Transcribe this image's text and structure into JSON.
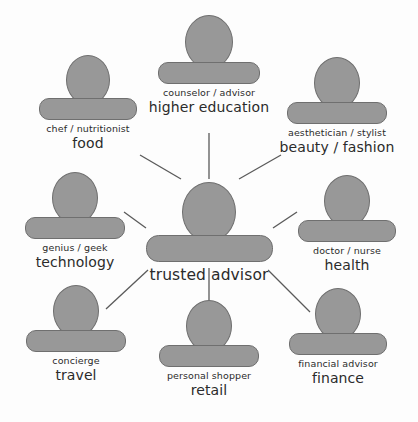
{
  "diagram": {
    "type": "hub-and-spoke",
    "background_color": "#fdfdfd",
    "icon_fill": "#989898",
    "icon_stroke": "#6f6f6f",
    "edge_color": "#5a5a5a",
    "text_color": "#2b2b2b"
  },
  "center": {
    "id": "trusted-advisor",
    "role": "",
    "category": "trusted advisor",
    "x": 209,
    "y": 182,
    "head_w": 52,
    "head_h": 58,
    "body_w": 125,
    "body_h": 25
  },
  "nodes": [
    {
      "id": "food",
      "role": "chef / nutritionist",
      "category": "food",
      "x": 88,
      "y": 55,
      "head_w": 42,
      "head_h": 48,
      "body_w": 96,
      "body_h": 20
    },
    {
      "id": "higher-education",
      "role": "counselor / advisor",
      "category": "higher education",
      "x": 209,
      "y": 15,
      "head_w": 46,
      "head_h": 52,
      "body_w": 100,
      "body_h": 20
    },
    {
      "id": "beauty-fashion",
      "role": "aesthetician / stylist",
      "category": "beauty / fashion",
      "x": 337,
      "y": 57,
      "head_w": 44,
      "head_h": 50,
      "body_w": 98,
      "body_h": 20
    },
    {
      "id": "technology",
      "role": "genius / geek",
      "category": "technology",
      "x": 75,
      "y": 172,
      "head_w": 44,
      "head_h": 50,
      "body_w": 98,
      "body_h": 20
    },
    {
      "id": "health",
      "role": "doctor / nurse",
      "category": "health",
      "x": 347,
      "y": 175,
      "head_w": 44,
      "head_h": 50,
      "body_w": 96,
      "body_h": 20
    },
    {
      "id": "travel",
      "role": "concierge",
      "category": "travel",
      "x": 76,
      "y": 285,
      "head_w": 44,
      "head_h": 50,
      "body_w": 98,
      "body_h": 20
    },
    {
      "id": "retail",
      "role": "personal shopper",
      "category": "retail",
      "x": 209,
      "y": 300,
      "head_w": 44,
      "head_h": 50,
      "body_w": 98,
      "body_h": 20
    },
    {
      "id": "finance",
      "role": "financial advisor",
      "category": "finance",
      "x": 338,
      "y": 288,
      "head_w": 44,
      "head_h": 50,
      "body_w": 96,
      "body_h": 20
    }
  ],
  "edges": [
    {
      "from": "food",
      "to": "trusted-advisor",
      "x1": 140,
      "y1": 155,
      "x2": 181,
      "y2": 179
    },
    {
      "from": "higher-education",
      "to": "trusted-advisor",
      "x1": 209,
      "y1": 133,
      "x2": 209,
      "y2": 179
    },
    {
      "from": "beauty-fashion",
      "to": "trusted-advisor",
      "x1": 281,
      "y1": 155,
      "x2": 239,
      "y2": 179
    },
    {
      "from": "technology",
      "to": "trusted-advisor",
      "x1": 124,
      "y1": 212,
      "x2": 146,
      "y2": 228
    },
    {
      "from": "health",
      "to": "trusted-advisor",
      "x1": 297,
      "y1": 212,
      "x2": 273,
      "y2": 228
    },
    {
      "from": "travel",
      "to": "trusted-advisor",
      "x1": 106,
      "y1": 309,
      "x2": 148,
      "y2": 270
    },
    {
      "from": "retail",
      "to": "trusted-advisor",
      "x1": 209,
      "y1": 312,
      "x2": 209,
      "y2": 268
    },
    {
      "from": "finance",
      "to": "trusted-advisor",
      "x1": 310,
      "y1": 312,
      "x2": 268,
      "y2": 270
    }
  ]
}
